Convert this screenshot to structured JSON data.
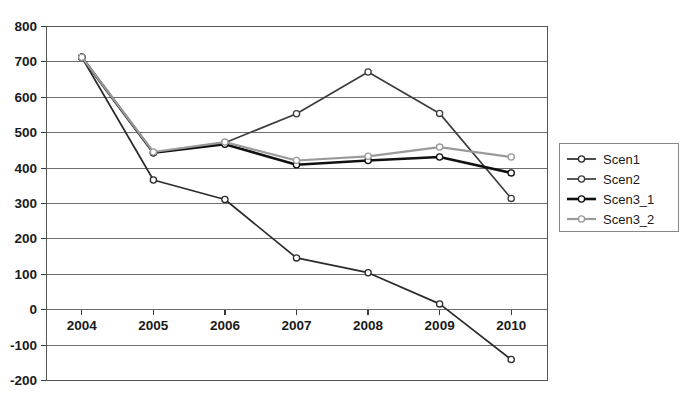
{
  "chart_data": {
    "type": "line",
    "title": "",
    "subtitle": "",
    "xlabel": "",
    "ylabel": "",
    "categories": [
      "2004",
      "2005",
      "2006",
      "2007",
      "2008",
      "2009",
      "2010"
    ],
    "x": [
      2004,
      2005,
      2006,
      2007,
      2008,
      2009,
      2010
    ],
    "ylim": [
      -200,
      800
    ],
    "ytick_values": [
      800,
      700,
      600,
      500,
      400,
      300,
      200,
      100,
      0,
      -100,
      -200
    ],
    "ytick_labels": [
      "800",
      "700",
      "600",
      "500",
      "400",
      "300",
      "200",
      "100",
      "0",
      "-100",
      "-200"
    ],
    "grid": "horizontal",
    "legend_position": "right",
    "series": [
      {
        "name": "Scen1",
        "color": "#2b2b2b",
        "width": 1.7,
        "marker": "circle-open",
        "values": [
          712,
          365,
          310,
          145,
          103,
          15,
          -142
        ]
      },
      {
        "name": "Scen2",
        "color": "#3d3d3d",
        "width": 1.7,
        "marker": "circle-open",
        "values": [
          712,
          442,
          470,
          552,
          670,
          553,
          313
        ]
      },
      {
        "name": "Scen3_1",
        "color": "#111111",
        "width": 2.6,
        "marker": "circle-open",
        "values": [
          712,
          442,
          466,
          408,
          420,
          430,
          385
        ]
      },
      {
        "name": "Scen3_2",
        "color": "#9a9a9a",
        "width": 2.2,
        "marker": "circle-open",
        "values": [
          712,
          444,
          472,
          420,
          432,
          458,
          430
        ]
      }
    ],
    "legend_entries": [
      {
        "label": "Scen1",
        "color": "#2b2b2b",
        "width": 1.7
      },
      {
        "label": "Scen2",
        "color": "#3d3d3d",
        "width": 1.7
      },
      {
        "label": "Scen3_1",
        "color": "#111111",
        "width": 2.6
      },
      {
        "label": "Scen3_2",
        "color": "#9a9a9a",
        "width": 2.2
      }
    ],
    "plot_area": {
      "left": 46,
      "right": 547,
      "top": 26,
      "bottom": 380
    },
    "category_label_y": 330
  }
}
